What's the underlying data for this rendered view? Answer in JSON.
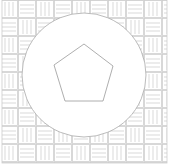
{
  "diagram": {
    "background_pattern": "basket-weave",
    "tile_size": 18,
    "line_color": "#c8c8c8",
    "circle": {
      "cx": 84,
      "cy": 75,
      "r": 62,
      "stroke": "#aaaaaa",
      "fill": "#ffffff"
    },
    "pentagon": {
      "points": "84,44 113,66 103,101 65,101 54,65",
      "stroke": "#999999",
      "fill": "#ffffff"
    }
  }
}
